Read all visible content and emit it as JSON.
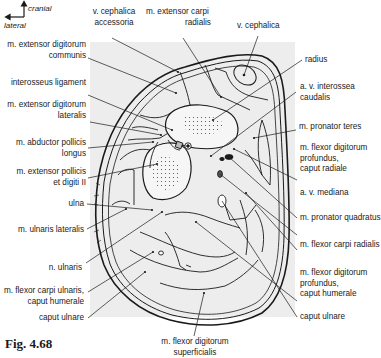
{
  "figure": {
    "label": "Fig. 4.68",
    "orientation": {
      "up": "cranial",
      "left": "lateral"
    },
    "background_shade": "#ececec",
    "line_color": "#1a1a1a"
  },
  "labels": {
    "top": [
      {
        "id": "v-cephalica-accessoria",
        "lines": [
          "v. cephalica",
          "accessoria"
        ]
      },
      {
        "id": "m-extensor-carpi-radialis",
        "lines": [
          "m. extensor carpi",
          "radialis"
        ]
      },
      {
        "id": "v-cephalica",
        "lines": [
          "v. cephalica"
        ]
      }
    ],
    "left": [
      {
        "id": "m-extensor-digitorum-communis",
        "lines": [
          "m. extensor digitorum",
          "communis"
        ]
      },
      {
        "id": "interosseus-ligament",
        "lines": [
          "interosseus ligament"
        ]
      },
      {
        "id": "m-extensor-digitorum-lateralis",
        "lines": [
          "m. extensor digitorum",
          "lateralis"
        ]
      },
      {
        "id": "m-abductor-pollicis-longus",
        "lines": [
          "m. abductor pollicis",
          "longus"
        ]
      },
      {
        "id": "m-extensor-pollicis-et-digiti-ii",
        "lines": [
          "m. extensor pollicis",
          "et digiti II"
        ]
      },
      {
        "id": "ulna",
        "lines": [
          "ulna"
        ]
      },
      {
        "id": "m-ulnaris-lateralis",
        "lines": [
          "m. ulnaris lateralis"
        ]
      },
      {
        "id": "n-ulnaris",
        "lines": [
          "n. ulnaris"
        ]
      },
      {
        "id": "m-flexor-carpi-ulnaris-caput-humerale",
        "lines": [
          "m. flexor carpi ulnaris,",
          "caput humerale"
        ]
      },
      {
        "id": "caput-ulnare-left",
        "lines": [
          "caput ulnare"
        ]
      }
    ],
    "right": [
      {
        "id": "radius",
        "lines": [
          "radius"
        ]
      },
      {
        "id": "a-v-interossea-caudalis",
        "lines": [
          "a. v. interossea",
          "caudalis"
        ]
      },
      {
        "id": "m-pronator-teres",
        "lines": [
          "m. pronator teres"
        ]
      },
      {
        "id": "m-flexor-digitorum-profundus-caput-radiale",
        "lines": [
          "m. flexor digitorum",
          "profundus,",
          "caput radiale"
        ]
      },
      {
        "id": "a-v-mediana",
        "lines": [
          "a. v. mediana"
        ]
      },
      {
        "id": "m-pronator-quadratus",
        "lines": [
          "m. pronator quadratus"
        ]
      },
      {
        "id": "m-flexor-carpi-radialis",
        "lines": [
          "m. flexor carpi radialis"
        ]
      },
      {
        "id": "m-flexor-digitorum-profundus-caput-humerale",
        "lines": [
          "m. flexor digitorum",
          "profundus,",
          "caput humerale"
        ]
      },
      {
        "id": "caput-ulnare-right",
        "lines": [
          "caput ulnare"
        ]
      }
    ],
    "bottom": [
      {
        "id": "m-flexor-digitorum-superficialis",
        "lines": [
          "m. flexor digitorum",
          "superficialis"
        ]
      }
    ]
  }
}
